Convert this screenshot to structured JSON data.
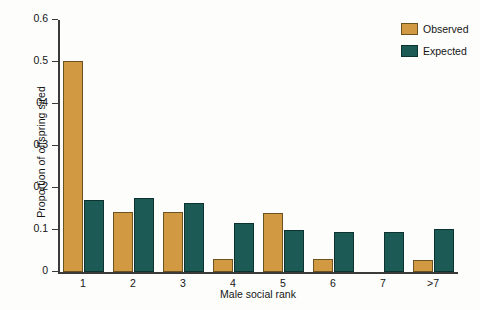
{
  "chart_data": {
    "type": "bar",
    "title": "",
    "xlabel": "Male social rank",
    "ylabel": "Proportion of offspring sired",
    "categories": [
      "1",
      "2",
      "3",
      "4",
      "5",
      "6",
      "7",
      ">7"
    ],
    "series": [
      {
        "name": "Observed",
        "color": "#d19a42",
        "values": [
          0.503,
          0.142,
          0.144,
          0.032,
          0.14,
          0.031,
          0,
          0.029
        ]
      },
      {
        "name": "Expected",
        "color": "#1b5a55",
        "values": [
          0.172,
          0.176,
          0.165,
          0.116,
          0.099,
          0.096,
          0.095,
          0.102
        ]
      }
    ],
    "ylim": [
      0,
      0.6
    ],
    "ytick_values": [
      0,
      0.1,
      0.2,
      0.3,
      0.4,
      0.5,
      0.6
    ],
    "ytick_labels": [
      "0",
      "0.1",
      "0.2",
      "0.3",
      "04",
      "0.5",
      "0.6"
    ],
    "grid": false,
    "legend_position": "top-right"
  },
  "legend": {
    "entries": [
      {
        "label": "Observed"
      },
      {
        "label": "Expected"
      }
    ]
  }
}
